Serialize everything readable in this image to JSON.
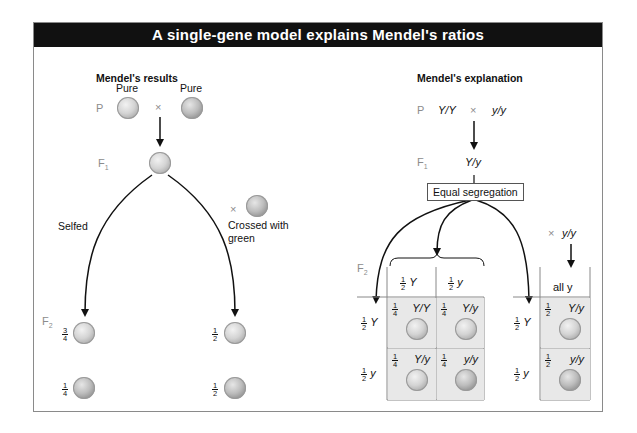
{
  "title": "A single-gene model explains Mendel's ratios",
  "left_panel": {
    "heading": "Mendel's results",
    "p_label": "P",
    "parent_labels": [
      "Pure",
      "Pure"
    ],
    "cross_symbol": "×",
    "f1_label": "F",
    "f1_sub": "1",
    "branch_left_label": "Selfed",
    "branch_right_label_line1": "Crossed with",
    "branch_right_label_line2": "green",
    "f2_label": "F",
    "f2_sub": "2",
    "selfed_results": [
      {
        "num": "3",
        "den": "4",
        "color": "yellow"
      },
      {
        "num": "1",
        "den": "4",
        "color": "green"
      }
    ],
    "testcross_results": [
      {
        "num": "1",
        "den": "2",
        "color": "yellow"
      },
      {
        "num": "1",
        "den": "2",
        "color": "green"
      }
    ]
  },
  "right_panel": {
    "heading": "Mendel's explanation",
    "p_label": "P",
    "p_cross": {
      "left": "Y/Y",
      "symbol": "×",
      "right": "y/y"
    },
    "f1_label": "F",
    "f1_sub": "1",
    "f1_genotype": "Y/y",
    "segregation_box": "Equal segregation",
    "f2_label": "F",
    "f2_sub": "2",
    "punnett": {
      "col_headers": [
        {
          "num": "1",
          "den": "2",
          "allele": "Y"
        },
        {
          "num": "1",
          "den": "2",
          "allele": "y"
        }
      ],
      "row_headers": [
        {
          "num": "1",
          "den": "2",
          "allele": "Y"
        },
        {
          "num": "1",
          "den": "2",
          "allele": "y"
        }
      ],
      "cells": [
        [
          {
            "num": "1",
            "den": "4",
            "genotype": "Y/Y",
            "color": "yellow"
          },
          {
            "num": "1",
            "den": "4",
            "genotype": "Y/y",
            "color": "yellow"
          }
        ],
        [
          {
            "num": "1",
            "den": "4",
            "genotype": "Y/y",
            "color": "yellow"
          },
          {
            "num": "1",
            "den": "4",
            "genotype": "y/y",
            "color": "green"
          }
        ]
      ]
    },
    "testcross": {
      "cross_symbol": "×",
      "cross_genotype": "y/y",
      "col_header": "all y",
      "row_headers": [
        {
          "num": "1",
          "den": "2",
          "allele": "Y"
        },
        {
          "num": "1",
          "den": "2",
          "allele": "y"
        }
      ],
      "cells": [
        {
          "num": "1",
          "den": "2",
          "genotype": "Y/y",
          "color": "yellow"
        },
        {
          "num": "1",
          "den": "2",
          "genotype": "y/y",
          "color": "green"
        }
      ]
    }
  },
  "colors": {
    "header_bg": "#111111",
    "header_text": "#ffffff",
    "cell_bg": "#e8e8e8",
    "generation_label": "#8c8c8c"
  }
}
